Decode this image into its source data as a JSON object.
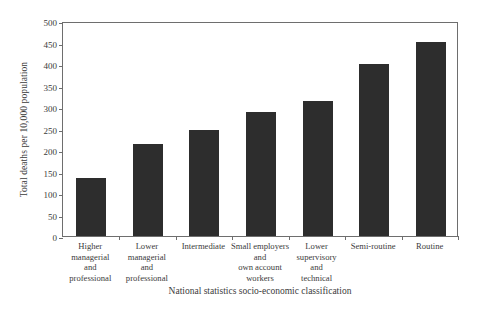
{
  "chart_data": {
    "type": "bar",
    "title": "",
    "xlabel": "National statistics socio-economic classification",
    "ylabel": "Total deaths per 10,000 population",
    "categories": [
      "Higher\nmanagerial\nand\nprofessional",
      "Lower\nmanagerial\nand\nprofessional",
      "Intermediate",
      "Small employers\nand\nown account\nworkers",
      "Lower\nsupervisory\nand\ntechnical",
      "Semi-routine",
      "Routine"
    ],
    "values": [
      135,
      214,
      246,
      288,
      314,
      400,
      452
    ],
    "ylim": [
      0,
      500
    ],
    "yticks": [
      0,
      50,
      100,
      150,
      200,
      250,
      300,
      350,
      400,
      450,
      500
    ],
    "ytick_labels": [
      "0",
      "50",
      "100",
      "150",
      "200",
      "250",
      "300",
      "350",
      "400",
      "450",
      "500"
    ],
    "grid": false,
    "legend": false,
    "bar_color": "#2d2d2d",
    "axis_color": "#6e6e6e",
    "text_color": "#3b3b3b",
    "background": "#ffffff"
  }
}
